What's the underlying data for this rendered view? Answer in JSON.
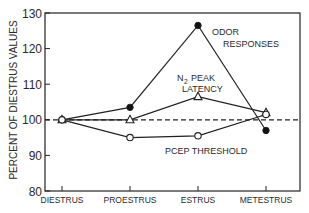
{
  "chart_data": {
    "type": "line",
    "title": "",
    "xlabel": "",
    "ylabel": "PERCENT OF DIESTRUS VALUES",
    "ylim": [
      80,
      130
    ],
    "yticks": [
      80,
      90,
      100,
      110,
      120,
      130
    ],
    "categories": [
      "DIESTRUS",
      "PROESTRUS",
      "ESTRUS",
      "METESTRUS"
    ],
    "grid": false,
    "reference_line": {
      "y": 100,
      "style": "dashed"
    },
    "series": [
      {
        "name": "ODOR RESPONSES",
        "marker": "filled-circle",
        "values": [
          100,
          103.5,
          126.5,
          97
        ]
      },
      {
        "name": "N2 PEAK LATENCY",
        "marker": "open-triangle",
        "values": [
          100,
          100,
          106.5,
          102
        ]
      },
      {
        "name": "PCEP THRESHOLD",
        "marker": "open-circle",
        "values": [
          100,
          95,
          95.5,
          101.5
        ]
      }
    ],
    "annotations": [
      {
        "text": "ODOR RESPONSES",
        "line1": "ODOR",
        "line2": "RESPONSES"
      },
      {
        "text": "N2 PEAK LATENCY",
        "line1": "N",
        "sub": "2",
        "line1b": "PEAK",
        "line2": "LATENCY"
      },
      {
        "text": "PCEP THRESHOLD"
      }
    ],
    "legend": "inline labels"
  }
}
